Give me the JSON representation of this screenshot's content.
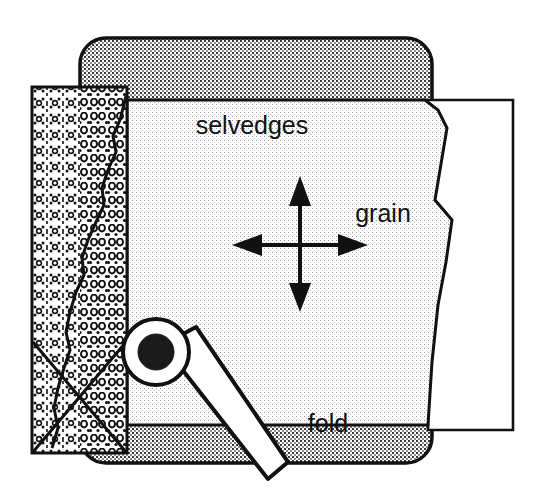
{
  "figure": {
    "labels": {
      "selvedges": "selvedges",
      "grain": "grain",
      "fold": "fold"
    },
    "colors": {
      "outline": "#111111",
      "mat_fill": "#bfbfbf",
      "fabric_light_fill": "#ebebeb",
      "fabric_print_fill": "#f2f2f2",
      "paper_white": "#ffffff",
      "blade_hub": "#1a1a1a"
    },
    "parts": [
      {
        "name": "cutting-mat",
        "label": "cutting mat",
        "fill": "mat_fill",
        "texture": "fine-checker-dots",
        "corner_radius": 26
      },
      {
        "name": "fabric-printed-layer",
        "label": "printed fabric layer",
        "fill": "fabric_print_fill",
        "texture": "dotted-print-motif"
      },
      {
        "name": "fabric-light-layer",
        "label": "folded fabric top layer",
        "fill": "fabric_light_fill",
        "texture": "sparse-dots"
      },
      {
        "name": "paper-backing",
        "label": "paper backing",
        "fill": "paper_white",
        "texture": "none"
      },
      {
        "name": "rotary-cutter",
        "label": "rotary cutter",
        "blade_radius": 32,
        "hub_radius": 17
      },
      {
        "name": "grain-cross-arrows",
        "label": "grain direction double arrows",
        "directions": [
          "up",
          "down",
          "left",
          "right"
        ]
      },
      {
        "name": "cut-mark-x",
        "label": "X cut mark on printed fabric"
      }
    ]
  }
}
